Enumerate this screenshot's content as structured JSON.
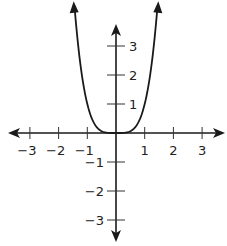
{
  "chart_data": {
    "type": "line",
    "title": "",
    "xlabel": "",
    "ylabel": "",
    "function": "y = x^4",
    "xlim": [
      -3.3,
      3.6
    ],
    "ylim": [
      -3.7,
      4.5
    ],
    "grid": false,
    "legend": null,
    "x_ticks": [
      -3,
      -2,
      -1,
      1,
      2,
      3
    ],
    "x_tick_labels": [
      "-3",
      "-2",
      "-1",
      "1",
      "2",
      "3"
    ],
    "y_ticks": [
      3,
      2,
      1,
      -1,
      -2,
      -3
    ],
    "y_tick_labels": [
      "3",
      "2",
      "1",
      "-1",
      "-2",
      "-3"
    ],
    "series": [
      {
        "name": "y = x^4",
        "x": [
          -1.44,
          -1.3,
          -1.2,
          -1.0,
          -0.8,
          -0.6,
          -0.4,
          -0.2,
          0,
          0.2,
          0.4,
          0.6,
          0.8,
          1.0,
          1.2,
          1.3,
          1.44
        ],
        "y": [
          4.3,
          2.86,
          2.07,
          1.0,
          0.41,
          0.13,
          0.03,
          0.0,
          0,
          0.0,
          0.03,
          0.13,
          0.41,
          1.0,
          2.07,
          2.86,
          4.3
        ]
      }
    ],
    "annotations": [
      "arrowheads at both ends of curve",
      "arrowheads at both ends of x and y axes"
    ]
  },
  "colors": {
    "axis": "#1a1a1a",
    "curve": "#1a1a1a",
    "tick": "#333333",
    "label": "#222222"
  }
}
